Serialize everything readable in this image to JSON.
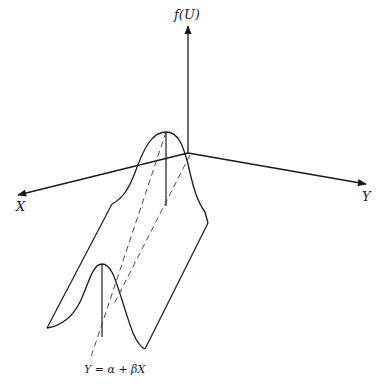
{
  "diagram": {
    "type": "3d-regression-distribution",
    "axes": {
      "vertical": "f(U)",
      "left": "X",
      "right": "Y"
    },
    "regression_line_label": "Y = α + βX",
    "elements": [
      "vertical axis f(U) with arrow",
      "X axis pointing lower-left with arrow",
      "Y axis pointing lower-right with arrow",
      "back bell-shaped density curve near origin",
      "front bell-shaped density curve",
      "ridge surface connecting curves",
      "dashed regression line Y = α + βX",
      "dashed parallel guide line",
      "vertical lines at curve peaks"
    ],
    "colors": {
      "line": "#1a1a1a",
      "background": "#ffffff"
    }
  }
}
